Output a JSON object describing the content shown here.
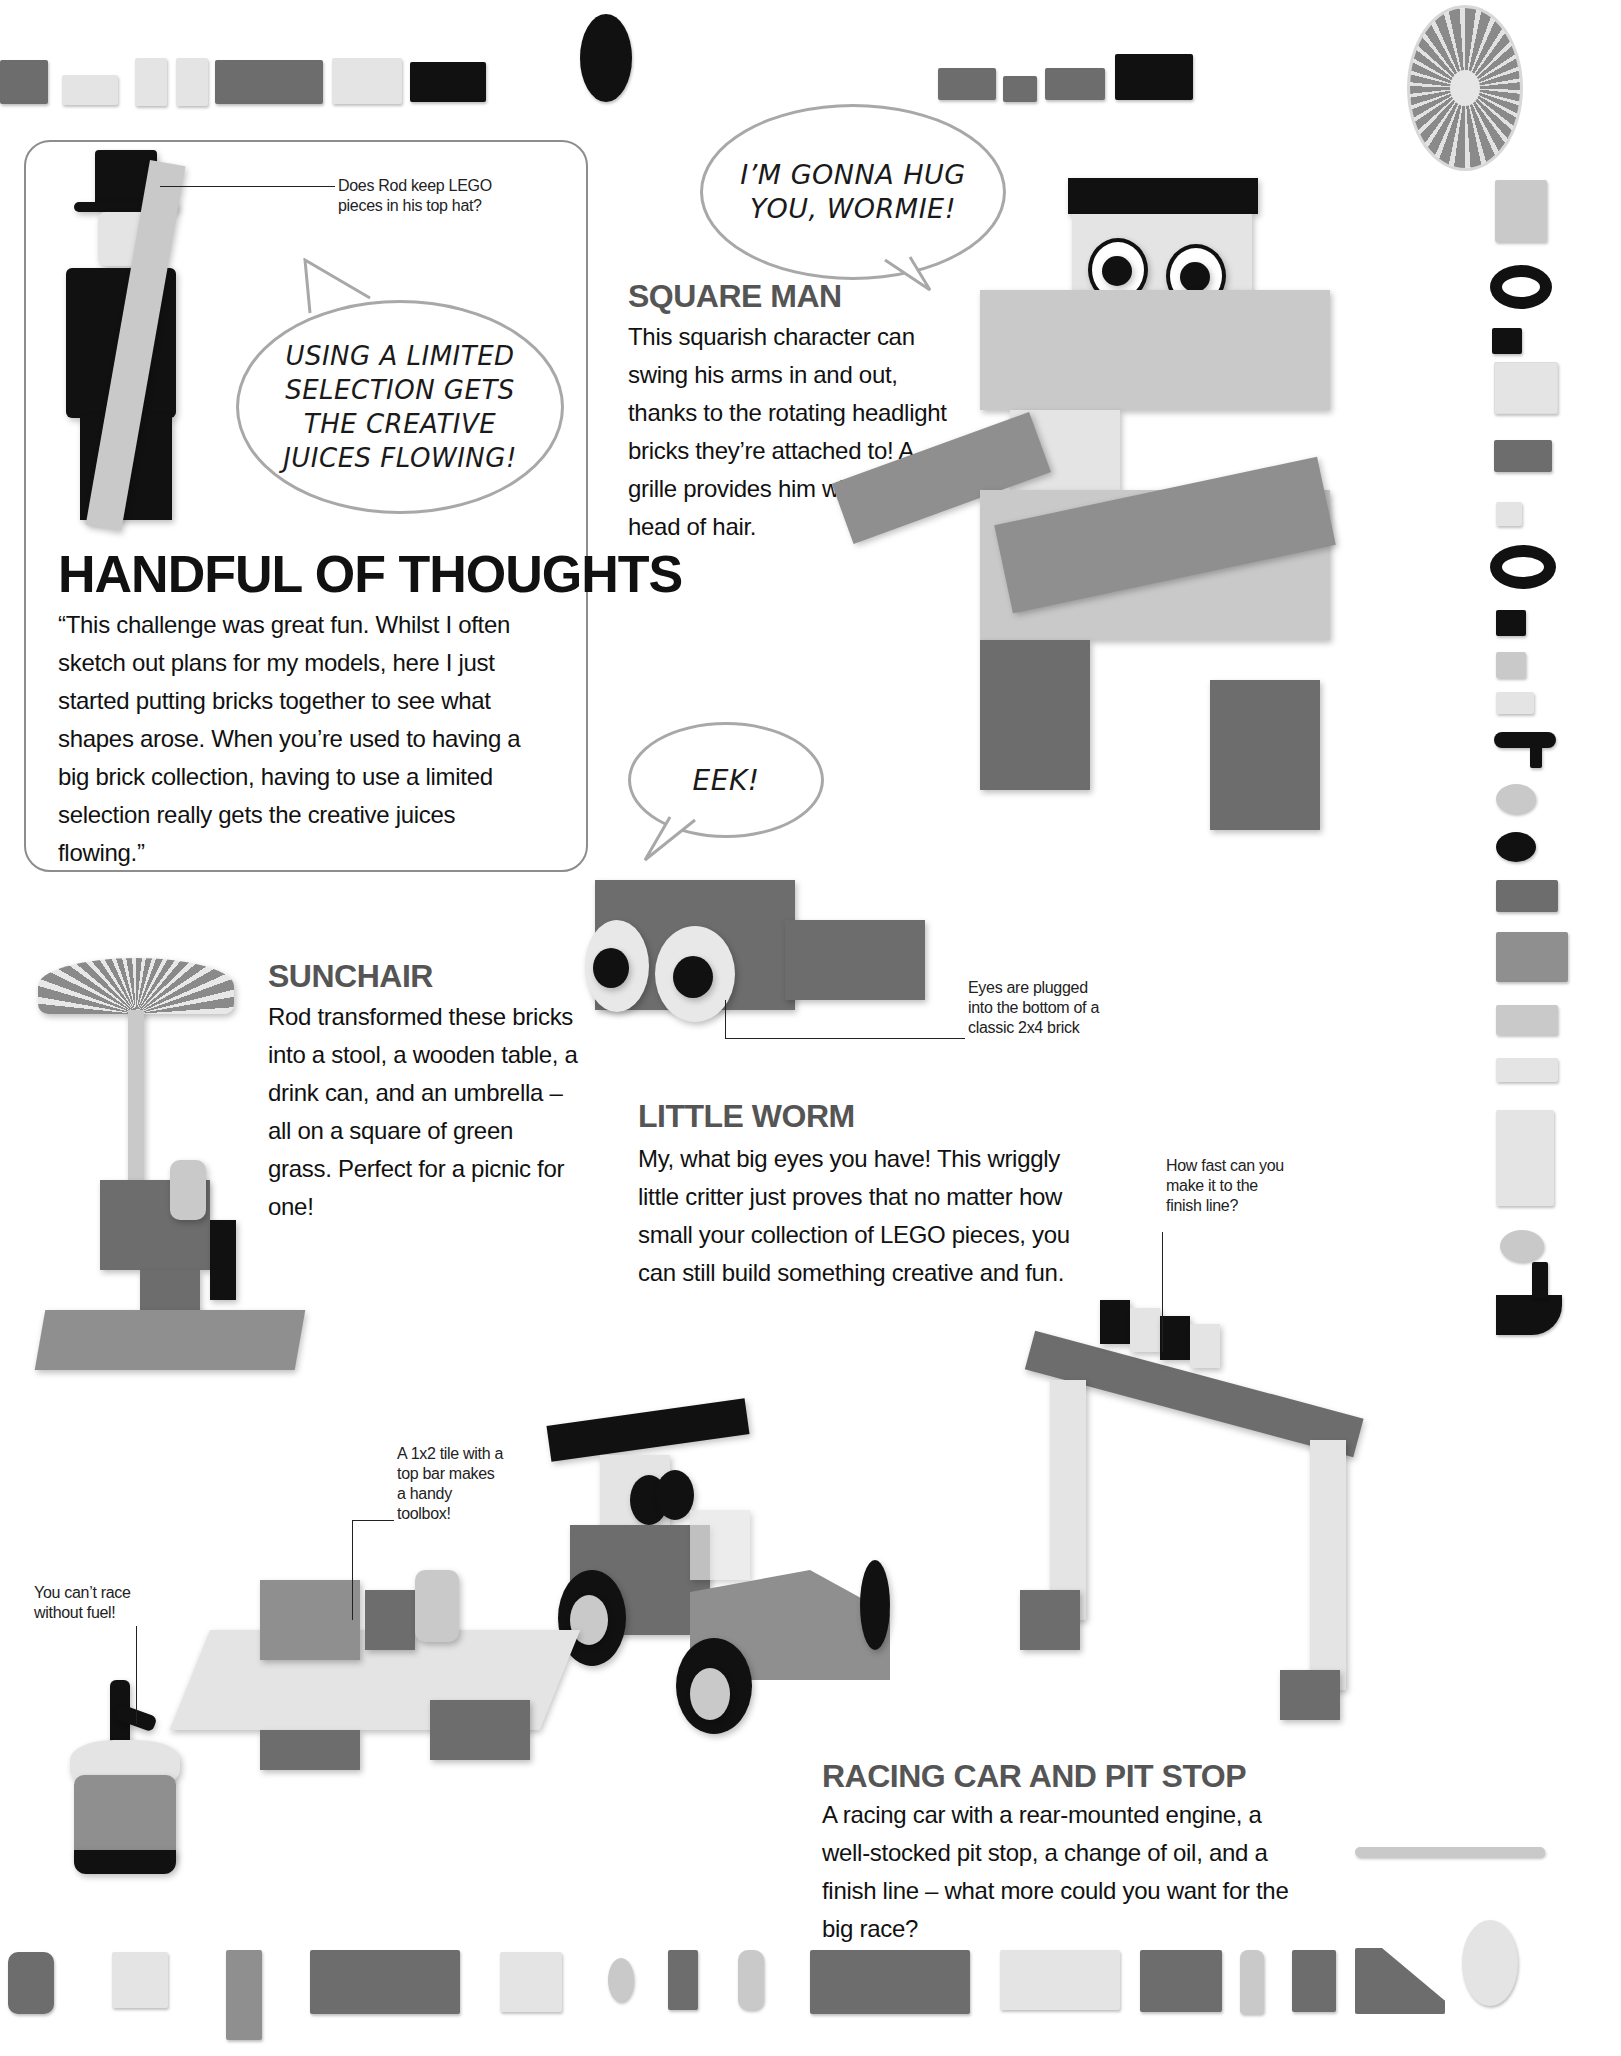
{
  "page": {
    "background": "#ffffff",
    "accent_heading_color": "#555555"
  },
  "quote_box": {
    "callout_hat": "Does Rod keep LEGO pieces in his top hat?",
    "speech_bubble": [
      "USING A LIMITED",
      "SELECTION GETS",
      "THE CREATIVE",
      "JUICES FLOWING!"
    ],
    "title": "HANDFUL OF THOUGHTS",
    "quote": "“This challenge was great fun. Whilst I often sketch out plans for my models, here I just started putting bricks together to see what shapes arose. When you’re used to having a big brick collection, having to use a limited selection really gets the creative juices flowing.”"
  },
  "square_man": {
    "speech_bubble": [
      "I’M GONNA HUG",
      "YOU, WORMIE!"
    ],
    "title": "SQUARE MAN",
    "description": "This squarish character can swing his arms in and out, thanks to the rotating headlight bricks they’re attached to! A grille provides him with a fine head of hair."
  },
  "little_worm": {
    "speech_bubble": "EEK!",
    "callout": "Eyes are plugged into the bottom of a classic 2x4 brick",
    "title": "LITTLE WORM",
    "description": "My, what big eyes you have! This wriggly little critter just proves that no matter how small your collection of LEGO pieces, you can still build something creative and fun."
  },
  "sunchair": {
    "title": "SUNCHAIR",
    "description": "Rod transformed these bricks into a stool, a wooden table, a drink can, and an umbrella – all on a square of green grass. Perfect for a picnic for one!"
  },
  "racing": {
    "callout_finish": "How fast can you make it to the finish line?",
    "callout_toolbox": "A 1x2 tile with a top bar makes a handy toolbox!",
    "callout_fuel": "You can’t race without fuel!",
    "title": "RACING CAR AND PIT STOP",
    "description": "A racing car with a rear-mounted engine, a well-stocked pit stop, a change of oil, and a finish line – what more could you want for the big race?"
  },
  "piece_strips": {
    "top": [
      "grille-slope-brick",
      "1x2-brick",
      "1x1-grille-slope",
      "1x1-grille-slope",
      "1x4-headlight-brick",
      "2x2-grille-slope",
      "technic-pin-brick",
      "round-plate-x-hole",
      "1x2-brick",
      "1x1-brick",
      "1x2-brick",
      "technic-pin-brick",
      "radar-dish-umbrella"
    ],
    "right": [
      "slope-brick",
      "tire",
      "clip-brick",
      "window-frame",
      "1x2-headlight",
      "1x1-headlight",
      "tire",
      "1x1-headlight",
      "1x1-headlight",
      "slope-small",
      "t-bar-hose",
      "wheel-rim",
      "round-tile",
      "1x2-headlight",
      "slope-large",
      "eye-brick",
      "eye-brick-white",
      "1x4-side-stud",
      "wheel-rim-small",
      "bracket-curve",
      "bar-pin"
    ],
    "bottom": [
      "round-brick",
      "1x2-brick",
      "1x4-tile-grille",
      "2x4-brick",
      "1x2-brick",
      "wheel-rim",
      "1x1-brick",
      "round-cone",
      "2x4-brick",
      "2x3-brick",
      "2x2-brick",
      "cone",
      "1x1-brick",
      "slope-brick",
      "round-dish"
    ]
  }
}
